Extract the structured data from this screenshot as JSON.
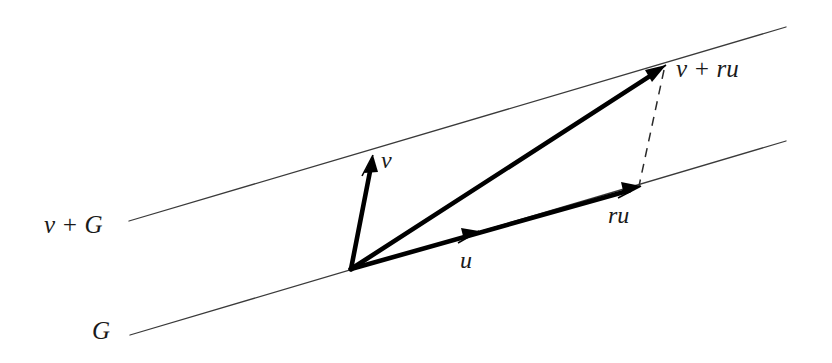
{
  "figure": {
    "type": "vector-diagram",
    "background_color": "#ffffff",
    "ink_color": "#1a1a1a",
    "thin_line_color": "#3a3a3a",
    "width": 832,
    "height": 363
  },
  "labels": {
    "coset_line": "v + G",
    "subgroup_line": "G",
    "vector_v": "v",
    "vector_u": "u",
    "vector_ru": "ru",
    "vector_v_plus_ru": "v + ru"
  },
  "geometry": {
    "lines": [
      {
        "name": "coset-line-v-plus-G",
        "label": "v + G",
        "x1": 129,
        "y1": 221,
        "x2": 786,
        "y2": 27,
        "style": "thin-solid"
      },
      {
        "name": "subgroup-line-G",
        "label": "G",
        "x1": 130,
        "y1": 335,
        "x2": 786,
        "y2": 141,
        "style": "thin-solid"
      }
    ],
    "origin": {
      "x": 351,
      "y": 269
    },
    "vectors": [
      {
        "name": "vector-v",
        "label": "v",
        "from": {
          "x": 351,
          "y": 269
        },
        "to": {
          "x": 373,
          "y": 156
        },
        "style": "thick-arrow"
      },
      {
        "name": "vector-u",
        "label": "u",
        "from": {
          "x": 351,
          "y": 269
        },
        "to": {
          "x": 492,
          "y": 228
        },
        "style": "thick-arrow-midpoint-tick"
      },
      {
        "name": "vector-ru",
        "label": "ru",
        "from": {
          "x": 351,
          "y": 269
        },
        "to": {
          "x": 638,
          "y": 188
        },
        "style": "thick-arrow"
      },
      {
        "name": "vector-v-plus-ru",
        "label": "v + ru",
        "from": {
          "x": 351,
          "y": 269
        },
        "to": {
          "x": 664,
          "y": 67
        },
        "style": "thick-arrow"
      }
    ],
    "dashed_connector": {
      "name": "dashed-translate-connector",
      "from": {
        "x": 664,
        "y": 70
      },
      "to": {
        "x": 639,
        "y": 186
      },
      "style": "dashed"
    }
  }
}
